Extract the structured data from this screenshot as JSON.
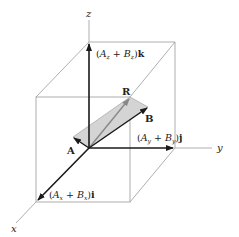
{
  "diagram": {
    "axes": {
      "x_label": "x",
      "y_label": "y",
      "z_label": "z"
    },
    "vectors": {
      "A_label": "A",
      "B_label": "B",
      "R_label": "R"
    },
    "components": {
      "k_component": {
        "open": "(",
        "a": "A",
        "a_sub": "z",
        "plus": " + ",
        "b": "B",
        "b_sub": "z",
        "close": ")",
        "unit": "k"
      },
      "j_component": {
        "open": "(",
        "a": "A",
        "a_sub": "y",
        "plus": " + ",
        "b": "B",
        "b_sub": "y",
        "close": ")",
        "unit": "j"
      },
      "i_component": {
        "open": "(",
        "a": "A",
        "a_sub": "x",
        "plus": " + ",
        "b": "B",
        "b_sub": "x",
        "close": ")",
        "unit": "i"
      }
    },
    "colors": {
      "box_line": "#9a9a9a",
      "vector": "#1a1a1a",
      "parallelogram_fill": "#d4d4d4",
      "resultant": "#888888"
    }
  }
}
